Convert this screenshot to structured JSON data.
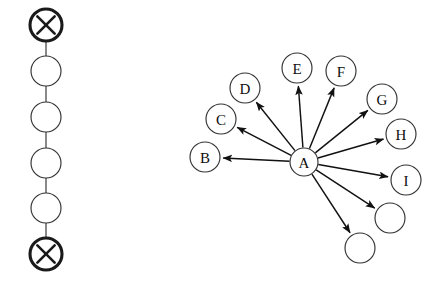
{
  "figure": {
    "background_color": "#ffffff",
    "width": 445,
    "height": 289
  },
  "style": {
    "node_fill": "#ffffff",
    "node_stroke": "#333333",
    "terminal_stroke": "#1a1a1a",
    "edge_color": "#111111",
    "chain_edge_color": "#4a4a4a",
    "label_color": "#0d0d0d"
  },
  "chain_graph": {
    "name": "left-chain-graph",
    "node_radius": 15,
    "terminal_radius": 16,
    "nodes": [
      {
        "id": "chain-terminal-top",
        "label": "",
        "glyph": "x-mark",
        "cx": 46,
        "cy": 25,
        "r": 16,
        "terminal": true
      },
      {
        "id": "chain-node-1",
        "label": "",
        "glyph": "",
        "cx": 46,
        "cy": 71,
        "r": 15,
        "terminal": false
      },
      {
        "id": "chain-node-2",
        "label": "",
        "glyph": "",
        "cx": 46,
        "cy": 117,
        "r": 15,
        "terminal": false
      },
      {
        "id": "chain-node-3",
        "label": "",
        "glyph": "",
        "cx": 46,
        "cy": 163,
        "r": 15,
        "terminal": false
      },
      {
        "id": "chain-node-4",
        "label": "",
        "glyph": "",
        "cx": 46,
        "cy": 208,
        "r": 15,
        "terminal": false
      },
      {
        "id": "chain-terminal-bottom",
        "label": "",
        "glyph": "x-mark",
        "cx": 46,
        "cy": 254,
        "r": 16,
        "terminal": true
      }
    ],
    "edges": [
      {
        "from": "chain-terminal-top",
        "to": "chain-node-1"
      },
      {
        "from": "chain-node-1",
        "to": "chain-node-2"
      },
      {
        "from": "chain-node-2",
        "to": "chain-node-3"
      },
      {
        "from": "chain-node-3",
        "to": "chain-node-4"
      },
      {
        "from": "chain-node-4",
        "to": "chain-terminal-bottom"
      }
    ]
  },
  "star_graph": {
    "name": "right-star-graph",
    "center_id": "node-A",
    "node_radius": 15,
    "nodes": [
      {
        "id": "node-A",
        "label": "A",
        "cx": 304,
        "cy": 162,
        "r": 14
      },
      {
        "id": "node-B",
        "label": "B",
        "cx": 205,
        "cy": 157,
        "r": 15
      },
      {
        "id": "node-C",
        "label": "C",
        "cx": 221,
        "cy": 119,
        "r": 15
      },
      {
        "id": "node-D",
        "label": "D",
        "cx": 245,
        "cy": 88,
        "r": 15
      },
      {
        "id": "node-E",
        "label": "E",
        "cx": 297,
        "cy": 68,
        "r": 15
      },
      {
        "id": "node-F",
        "label": "F",
        "cx": 341,
        "cy": 71,
        "r": 15
      },
      {
        "id": "node-G",
        "label": "G",
        "cx": 382,
        "cy": 99,
        "r": 15
      },
      {
        "id": "node-H",
        "label": "H",
        "cx": 401,
        "cy": 134,
        "r": 15
      },
      {
        "id": "node-I",
        "label": "I",
        "cx": 406,
        "cy": 180,
        "r": 15
      },
      {
        "id": "node-unlabeled-1",
        "label": "",
        "cx": 390,
        "cy": 218,
        "r": 15
      },
      {
        "id": "node-unlabeled-2",
        "label": "",
        "cx": 360,
        "cy": 248,
        "r": 15
      }
    ],
    "edges": [
      {
        "from": "node-A",
        "to": "node-B",
        "directed": true
      },
      {
        "from": "node-A",
        "to": "node-C",
        "directed": true
      },
      {
        "from": "node-A",
        "to": "node-D",
        "directed": true
      },
      {
        "from": "node-A",
        "to": "node-E",
        "directed": true
      },
      {
        "from": "node-A",
        "to": "node-F",
        "directed": true
      },
      {
        "from": "node-A",
        "to": "node-G",
        "directed": true
      },
      {
        "from": "node-A",
        "to": "node-H",
        "directed": true
      },
      {
        "from": "node-A",
        "to": "node-I",
        "directed": true
      },
      {
        "from": "node-A",
        "to": "node-unlabeled-1",
        "directed": true
      },
      {
        "from": "node-A",
        "to": "node-unlabeled-2",
        "directed": true
      }
    ]
  }
}
